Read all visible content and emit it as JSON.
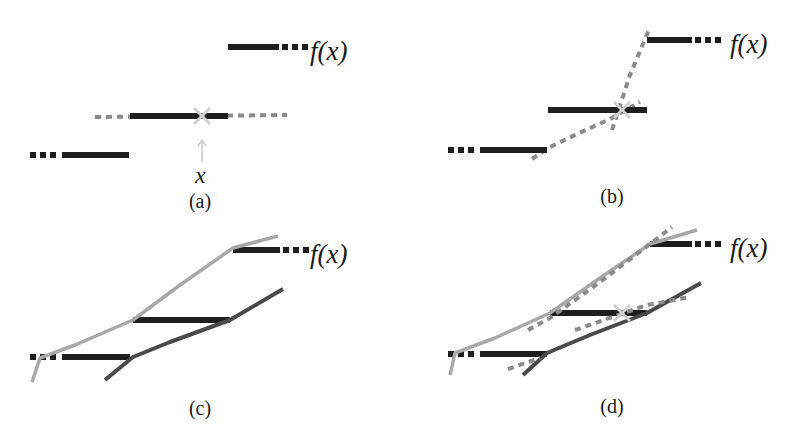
{
  "colors": {
    "step": "#1e1e1e",
    "dashed_gray": "#8a8a8a",
    "light_line": "#a8a8a8",
    "dark_line": "#4a4a4a",
    "cross": "#d0d0d0",
    "arrow": "#c8c8c8"
  },
  "labels": {
    "fx": "f(x)",
    "x": "x",
    "captions": [
      "(a)",
      "(b)",
      "(c)",
      "(d)"
    ]
  },
  "panels": [
    {
      "id": "a",
      "caption": "(a)",
      "steps": [
        {
          "x1": 62,
          "x2": 129,
          "y": 155,
          "dots_left": true
        },
        {
          "x1": 130,
          "x2": 228,
          "y": 116,
          "dots_left": false
        },
        {
          "x1": 228,
          "x2": 279,
          "y": 47,
          "dots_right": true
        }
      ],
      "dashed_lines": [
        [
          [
            95,
            117
          ],
          [
            287,
            115
          ]
        ]
      ],
      "cross": {
        "x": 202,
        "y": 116
      },
      "arrow": {
        "x": 202,
        "y1": 162,
        "y2": 140
      },
      "fx_label": {
        "x": 310,
        "y": 60
      },
      "x_label": {
        "x": 195,
        "y": 183
      },
      "caption_pos": {
        "x": 200,
        "y": 208
      }
    },
    {
      "id": "b",
      "caption": "(b)",
      "steps": [
        {
          "x1": 480,
          "x2": 547,
          "y": 150,
          "dots_left": true
        },
        {
          "x1": 548,
          "x2": 647,
          "y": 110,
          "dots_left": false
        },
        {
          "x1": 647,
          "x2": 692,
          "y": 40,
          "dots_right": true
        }
      ],
      "dashed_lines": [
        [
          [
            532,
            159
          ],
          [
            548,
            148
          ],
          [
            575,
            135
          ],
          [
            612,
            118
          ],
          [
            640,
            102
          ]
        ],
        [
          [
            612,
            130
          ],
          [
            630,
            75
          ],
          [
            650,
            27
          ]
        ]
      ],
      "cross": {
        "x": 622,
        "y": 110
      },
      "fx_label": {
        "x": 730,
        "y": 53
      },
      "caption_pos": {
        "x": 612,
        "y": 203
      }
    },
    {
      "id": "c",
      "caption": "(c)",
      "steps": [
        {
          "x1": 62,
          "x2": 130,
          "y": 357,
          "dots_left": true
        },
        {
          "x1": 133,
          "x2": 230,
          "y": 320,
          "dots_left": false
        },
        {
          "x1": 233,
          "x2": 280,
          "y": 250,
          "dots_right": true
        }
      ],
      "light_line": [
        [
          32,
          382
        ],
        [
          40,
          358
        ],
        [
          75,
          345
        ],
        [
          133,
          320
        ],
        [
          180,
          285
        ],
        [
          233,
          248
        ],
        [
          278,
          236
        ]
      ],
      "dark_line": [
        [
          105,
          380
        ],
        [
          133,
          357
        ],
        [
          170,
          342
        ],
        [
          230,
          320
        ],
        [
          283,
          289
        ]
      ],
      "fx_label": {
        "x": 310,
        "y": 263
      },
      "caption_pos": {
        "x": 200,
        "y": 415
      }
    },
    {
      "id": "d",
      "caption": "(d)",
      "steps": [
        {
          "x1": 480,
          "x2": 547,
          "y": 354,
          "dots_left": true
        },
        {
          "x1": 550,
          "x2": 647,
          "y": 313,
          "dots_left": false
        },
        {
          "x1": 650,
          "x2": 692,
          "y": 244,
          "dots_right": true
        }
      ],
      "light_line": [
        [
          450,
          375
        ],
        [
          455,
          353
        ],
        [
          495,
          338
        ],
        [
          550,
          313
        ],
        [
          600,
          278
        ],
        [
          650,
          244
        ],
        [
          697,
          230
        ]
      ],
      "dark_line": [
        [
          523,
          375
        ],
        [
          547,
          353
        ],
        [
          590,
          335
        ],
        [
          647,
          313
        ],
        [
          701,
          283
        ]
      ],
      "dashed_lines": [
        [
          [
            508,
            369
          ],
          [
            540,
            358
          ]
        ],
        [
          [
            528,
            330
          ],
          [
            550,
            318
          ],
          [
            600,
            282
          ],
          [
            650,
            244
          ],
          [
            672,
            227
          ]
        ],
        [
          [
            575,
            330
          ],
          [
            647,
            305
          ],
          [
            690,
            297
          ]
        ]
      ],
      "cross": {
        "x": 622,
        "y": 313
      },
      "fx_label": {
        "x": 730,
        "y": 257
      },
      "caption_pos": {
        "x": 612,
        "y": 413
      }
    }
  ]
}
